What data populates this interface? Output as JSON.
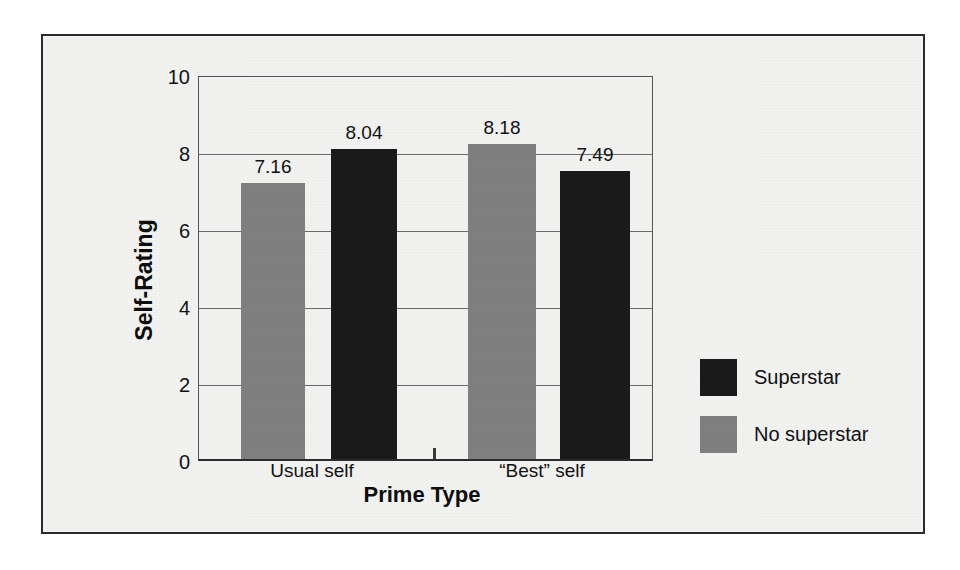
{
  "figure": {
    "frame_color": "#2b2b2b",
    "background_color": "#f2f2f1"
  },
  "chart_data": {
    "type": "bar",
    "title": "",
    "xlabel": "Prime Type",
    "ylabel": "Self-Rating",
    "categories": [
      "Usual self",
      "“Best” self"
    ],
    "series": [
      {
        "name": "No superstar",
        "color": "#808080",
        "values": [
          7.16,
          8.18
        ]
      },
      {
        "name": "Superstar",
        "color": "#1a1a1a",
        "values": [
          8.04,
          7.49
        ]
      }
    ],
    "bars": [
      {
        "category": "Usual self",
        "series": "No superstar",
        "value": 7.16,
        "label": "7.16",
        "color": "#808080"
      },
      {
        "category": "Usual self",
        "series": "Superstar",
        "value": 8.04,
        "label": "8.04",
        "color": "#1a1a1a"
      },
      {
        "category": "“Best” self",
        "series": "No superstar",
        "value": 8.18,
        "label": "8.18",
        "color": "#808080"
      },
      {
        "category": "“Best” self",
        "series": "Superstar",
        "value": 7.49,
        "label": "7.49",
        "color": "#1a1a1a"
      }
    ],
    "ylim": [
      0,
      10
    ],
    "yticks": [
      0,
      2,
      4,
      6,
      8,
      10
    ],
    "ytick_labels": [
      "0",
      "2",
      "4",
      "6",
      "8",
      "10"
    ],
    "grid": true,
    "grid_axis": "y",
    "legend_position": "right",
    "legend": [
      {
        "label": "Superstar",
        "color": "#1a1a1a"
      },
      {
        "label": "No superstar",
        "color": "#808080"
      }
    ]
  },
  "ghost": {
    "lines": [
      "of the same sort of effect as a source of self-evaluative comparison",
      "a prime that is not easily attainable may produce contrast whereas",
      "identification with the model and assimilation toward the standard",
      "self. If the self is perceived as similar to the comparison target, then",
      "judgments can be assimilated toward the prime rather than contrasted",
      "General Conclusions and Directions",
      "The present studies suggest that social comparison can operate at",
      "a nonconscious level, and the consequences of such comparisons",
      "parallel those observed in more deliberate comparison settings. The",
      "findings have implications for both the social comparison literature",
      "and the literature on automatic behavior and trait activation, and",
      "they raise a number of questions for further research."
    ]
  }
}
